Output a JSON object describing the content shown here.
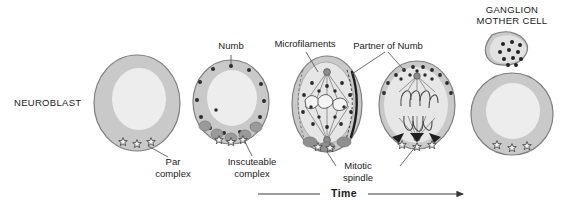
{
  "figure": {
    "title_left": "NEUROBLAST",
    "title_right_line1": "GANGLION",
    "title_right_line2": "MOTHER CELL",
    "axis_label": "Time",
    "labels": {
      "numb": "Numb",
      "microfilaments": "Microfilaments",
      "partner_of_numb": "Partner of Numb",
      "par_complex_line1": "Par",
      "par_complex_line2": "complex",
      "inscuteable_line1": "Inscuteable",
      "inscuteable_line2": "complex",
      "mitotic_line1": "Mitotic",
      "mitotic_line2": "spindle"
    },
    "colors": {
      "cytoplasm": "#c9c9c9",
      "nucleus": "#ececec",
      "membrane": "#8a8a8a",
      "numb_dot": "#2b2b2b",
      "inscuteable_blob": "#9a9a9a",
      "star_outline": "#3a3a3a",
      "spindle": "#6e6e6e",
      "chromosome": "#f2f2f2",
      "cortex_dark": "#1e1e1e",
      "leader": "#5a5a5a",
      "background": "#ffffff"
    },
    "stages": [
      {
        "name": "interphase-neuroblast",
        "dots": 0,
        "stars": 3,
        "blobs": 0
      },
      {
        "name": "polarized-neuroblast",
        "dots": 14,
        "stars": 3,
        "blobs": 5
      },
      {
        "name": "metaphase-neuroblast",
        "dots": 16,
        "stars": 0,
        "blobs": 0
      },
      {
        "name": "anaphase-neuroblast",
        "dots": 15,
        "stars": 3,
        "blobs": 0
      },
      {
        "name": "daughter-cells",
        "dots": 11,
        "stars": 3,
        "blobs": 0
      }
    ]
  }
}
